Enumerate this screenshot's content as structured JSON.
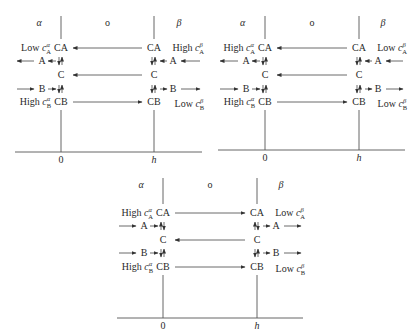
{
  "figure": {
    "panels": [
      {
        "id": "panel-1",
        "phases": {
          "left": "α",
          "middle": "o",
          "right": "β"
        },
        "axis": {
          "left_tick": "0",
          "right_tick": "h"
        },
        "rows": {
          "CA": "CA",
          "A": "A",
          "C": "C",
          "B": "B",
          "CB": "CB"
        },
        "left_labels": {
          "top": {
            "prefix": "Low",
            "symbol": "c",
            "sub": "A",
            "sup": "α"
          },
          "bottom": {
            "prefix": "High",
            "symbol": "c",
            "sub": "B",
            "sup": "α"
          }
        },
        "right_labels": {
          "top": {
            "prefix": "High",
            "symbol": "c",
            "sub": "A",
            "sup": "β"
          },
          "bottom": {
            "prefix": "Low",
            "symbol": "c",
            "sub": "B",
            "sup": "β"
          }
        },
        "flows": {
          "CA_membrane": "right-to-left",
          "C_membrane": "right-to-left",
          "CB_membrane": "left-to-right",
          "A_alpha_bulk": "leftward",
          "A_beta_bulk": "leftward",
          "B_alpha_bulk": "rightward",
          "B_beta_bulk": "rightward"
        }
      },
      {
        "id": "panel-2",
        "phases": {
          "left": "α",
          "middle": "o",
          "right": "β"
        },
        "axis": {
          "left_tick": "0",
          "right_tick": "h"
        },
        "rows": {
          "CA": "CA",
          "A": "A",
          "C": "C",
          "B": "B",
          "CB": "CB"
        },
        "left_labels": {
          "top": {
            "prefix": "High",
            "symbol": "c",
            "sub": "A",
            "sup": "α"
          },
          "bottom": {
            "prefix": "High",
            "symbol": "c",
            "sub": "B",
            "sup": "α"
          }
        },
        "right_labels": {
          "top": {
            "prefix": "Low",
            "symbol": "c",
            "sub": "A",
            "sup": "β"
          },
          "bottom": {
            "prefix": "Low",
            "symbol": "c",
            "sub": "B",
            "sup": "β"
          }
        },
        "flows": {
          "CA_membrane": "right-to-left",
          "C_membrane": "right-to-left",
          "CB_membrane": "left-to-right",
          "A_alpha_bulk": "leftward",
          "A_beta_bulk": "leftward",
          "B_alpha_bulk": "rightward",
          "B_beta_bulk": "rightward"
        }
      },
      {
        "id": "panel-3",
        "phases": {
          "left": "α",
          "middle": "o",
          "right": "β"
        },
        "axis": {
          "left_tick": "0",
          "right_tick": "h"
        },
        "rows": {
          "CA": "CA",
          "A": "A",
          "C": "C",
          "B": "B",
          "CB": "CB"
        },
        "left_labels": {
          "top": {
            "prefix": "High",
            "symbol": "c",
            "sub": "A",
            "sup": "α"
          },
          "bottom": {
            "prefix": "High",
            "symbol": "c",
            "sub": "B",
            "sup": "α"
          }
        },
        "right_labels": {
          "top": {
            "prefix": "Low",
            "symbol": "c",
            "sub": "A",
            "sup": "β"
          },
          "bottom": {
            "prefix": "Low",
            "symbol": "c",
            "sub": "B",
            "sup": "β"
          }
        },
        "flows": {
          "CA_membrane": "left-to-right",
          "C_membrane": "right-to-left",
          "CB_membrane": "left-to-right",
          "A_alpha_bulk": "rightward",
          "A_beta_bulk": "rightward",
          "B_alpha_bulk": "rightward",
          "B_beta_bulk": "rightward"
        }
      }
    ]
  }
}
